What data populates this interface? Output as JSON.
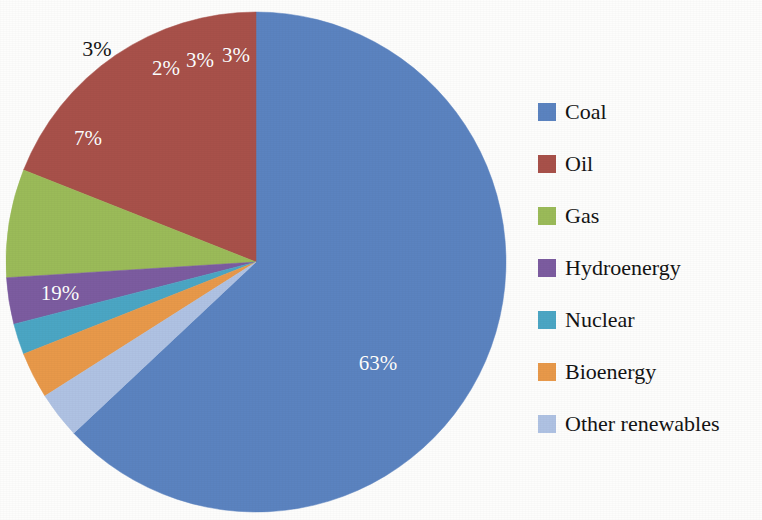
{
  "chart_data": {
    "type": "pie",
    "title": "",
    "subtitle": "",
    "xlabel": "",
    "ylabel": "",
    "legend_position": "right",
    "grid": false,
    "start_angle_deg": 0,
    "direction": "counterclockwise",
    "categories": [
      "Coal",
      "Oil",
      "Gas",
      "Hydroenergy",
      "Nuclear",
      "Bioenergy",
      "Other renewables"
    ],
    "values": [
      63,
      19,
      7,
      3,
      2,
      3,
      3
    ],
    "value_unit": "%",
    "slices": [
      {
        "label": "Coal",
        "value": 63,
        "value_text": "63%",
        "color": "#5B83C0",
        "label_position": "inside",
        "label_color": "#ffffff",
        "label_x": 378,
        "label_y": 363
      },
      {
        "label": "Oil",
        "value": 19,
        "value_text": "19%",
        "color": "#A8514A",
        "label_position": "inside",
        "label_color": "#ffffff",
        "label_x": 60,
        "label_y": 293
      },
      {
        "label": "Gas",
        "value": 7,
        "value_text": "7%",
        "color": "#9BBB59",
        "label_position": "inside",
        "label_color": "#ffffff",
        "label_x": 88,
        "label_y": 138
      },
      {
        "label": "Hydroenergy",
        "value": 3,
        "value_text": "3%",
        "color": "#7C5CA0",
        "label_position": "outside",
        "label_color": "#161616",
        "label_x": 97,
        "label_y": 49
      },
      {
        "label": "Nuclear",
        "value": 2,
        "value_text": "2%",
        "color": "#4BA6C4",
        "label_position": "inside",
        "label_color": "#ffffff",
        "label_x": 166,
        "label_y": 68
      },
      {
        "label": "Bioenergy",
        "value": 3,
        "value_text": "3%",
        "color": "#E8994A",
        "label_position": "inside",
        "label_color": "#ffffff",
        "label_x": 200,
        "label_y": 60
      },
      {
        "label": "Other renewables",
        "value": 3,
        "value_text": "3%",
        "color": "#AFC2E3",
        "label_position": "inside",
        "label_color": "#ffffff",
        "label_x": 236,
        "label_y": 55
      }
    ]
  },
  "legend": {
    "items": [
      {
        "label": "Coal",
        "color": "#5B83C0"
      },
      {
        "label": "Oil",
        "color": "#A8514A"
      },
      {
        "label": "Gas",
        "color": "#9BBB59"
      },
      {
        "label": "Hydroenergy",
        "color": "#7C5CA0"
      },
      {
        "label": "Nuclear",
        "color": "#4BA6C4"
      },
      {
        "label": "Bioenergy",
        "color": "#E8994A"
      },
      {
        "label": "Other renewables",
        "color": "#AFC2E3"
      }
    ]
  }
}
